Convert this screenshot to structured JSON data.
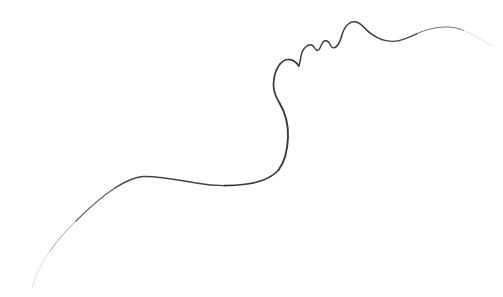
{
  "artwork": {
    "title": "Minimalist Single-Line Face Profile",
    "subject": "human-face-profile-contour",
    "medium": "pencil-line-drawing",
    "orientation": "profile-facing-upper-right",
    "canvas": {
      "width": 503,
      "height": 297,
      "background_color": "#ffffff"
    },
    "stroke": {
      "color": "#3a3a3e",
      "light_color": "#9a9aa0",
      "faint_color": "#cfcfd4",
      "max_width": 2.0,
      "min_width": 0.35
    },
    "anatomy_landmarks": [
      {
        "name": "tail-start-lower-left",
        "x": 32,
        "y": 286,
        "note": "faint fading tail tip"
      },
      {
        "name": "shoulder-rise",
        "x": 72,
        "y": 232
      },
      {
        "name": "shoulder-crest",
        "x": 140,
        "y": 176,
        "note": "highest point of left hump"
      },
      {
        "name": "trapezius-valley",
        "x": 222,
        "y": 185,
        "note": "flat low point"
      },
      {
        "name": "neck-base-turn",
        "x": 272,
        "y": 176
      },
      {
        "name": "neck-bulge",
        "x": 288,
        "y": 132,
        "note": "rightmost point of neck"
      },
      {
        "name": "neck-inflection",
        "x": 274,
        "y": 96
      },
      {
        "name": "chin-crest",
        "x": 288,
        "y": 60
      },
      {
        "name": "chin-notch",
        "x": 301,
        "y": 52,
        "note": "mentolabial sulcus"
      },
      {
        "name": "lower-lip",
        "x": 310,
        "y": 44
      },
      {
        "name": "lip-gap",
        "x": 317,
        "y": 49
      },
      {
        "name": "upper-lip",
        "x": 324,
        "y": 41
      },
      {
        "name": "philtrum-dip",
        "x": 331,
        "y": 46
      },
      {
        "name": "nose-base",
        "x": 338,
        "y": 40
      },
      {
        "name": "nose-tip",
        "x": 352,
        "y": 22,
        "note": "apex of the nose"
      },
      {
        "name": "nasal-bridge-dip",
        "x": 396,
        "y": 40,
        "note": "nasion / brow hollow"
      },
      {
        "name": "brow-forehead-crest",
        "x": 452,
        "y": 28
      },
      {
        "name": "tail-end-upper-right",
        "x": 492,
        "y": 42,
        "note": "faint fading tail tip"
      }
    ],
    "path_segments": [
      {
        "name": "lower-left-fading-tail",
        "d": "M 32.5 286.5 C 36 275 42 262 50.5 250.5",
        "stroke_width": 0.5,
        "opacity": 0.35
      },
      {
        "name": "shoulder-ascent",
        "d": "M 50.5 250.5 C 58 240 66 230 76 221",
        "stroke_width": 0.8,
        "opacity": 0.6
      },
      {
        "name": "shoulder-upper-slope",
        "d": "M 76 221 C 88 209 101 197 115 188",
        "stroke_width": 1.1,
        "opacity": 0.82
      },
      {
        "name": "shoulder-crest-to-valley",
        "d": "M 115 188 C 126 181 134 177 143 176.5 C 160 176 178 180 196 183 C 206 184.8 214 185.6 224 185.6",
        "stroke_width": 1.45,
        "opacity": 0.95
      },
      {
        "name": "valley-to-neck-base",
        "d": "M 224 185.6 C 238 185.6 252 184 262 180.5 C 269 178 274 175 278.5 170",
        "stroke_width": 1.6,
        "opacity": 1.0
      },
      {
        "name": "neck-column",
        "d": "M 278.5 170 C 284 163 287.5 150 288 137 C 288.3 124 285 112 279.5 103",
        "stroke_width": 1.9,
        "opacity": 1.0
      },
      {
        "name": "neck-to-jaw",
        "d": "M 279.5 103 C 275.5 96.5 273.2 91 273.5 84 C 273.8 76 276 69 280 64",
        "stroke_width": 1.7,
        "opacity": 1.0
      },
      {
        "name": "chin-curve",
        "d": "M 280 64 C 283 60.5 286.5 59 290 59.6 C 294 60.2 297 63 298.8 66",
        "stroke_width": 1.6,
        "opacity": 1.0
      },
      {
        "name": "chin-to-lower-lip",
        "d": "M 298.8 66 C 300.4 62 300.6 57 301.6 53.6 C 302.8 49.8 305 47 308 45.4",
        "stroke_width": 1.5,
        "opacity": 1.0
      },
      {
        "name": "lower-lip-bump",
        "d": "M 308 45.4 C 310.6 44.2 312.6 45 313.8 46.8 C 315 48.6 315.6 50 316.8 50.4",
        "stroke_width": 1.4,
        "opacity": 1.0
      },
      {
        "name": "lip-gap-to-upper-lip",
        "d": "M 316.8 50.4 C 318.6 50.8 320 48.6 321.4 45 C 322.6 42 324 40.4 326 40.8",
        "stroke_width": 1.4,
        "opacity": 1.0
      },
      {
        "name": "upper-lip-to-nose-base",
        "d": "M 326 40.8 C 328.4 41.2 329.8 43.6 330.8 45.8 C 332 48.2 334 48.6 336.6 46.4",
        "stroke_width": 1.4,
        "opacity": 1.0
      },
      {
        "name": "nose-underside",
        "d": "M 336.6 46.4 C 339.4 44 340.6 40 342 34.8 C 343.6 29 346.6 24.4 351 22.4",
        "stroke_width": 1.5,
        "opacity": 1.0
      },
      {
        "name": "nose-tip-to-bridge",
        "d": "M 351 22.4 C 355.6 20.6 359.4 22.6 363 26.6 C 368 32 374 37 382 39.6",
        "stroke_width": 1.5,
        "opacity": 1.0
      },
      {
        "name": "nasion-hollow",
        "d": "M 382 39.6 C 388 41.6 393 42 399 40.6 C 405.5 39 411 36.4 417 33.6",
        "stroke_width": 1.3,
        "opacity": 0.95
      },
      {
        "name": "brow-to-forehead",
        "d": "M 417 33.6 C 426 29.6 435 27.2 445 27 C 452 26.9 458 28 463 30.2",
        "stroke_width": 1.0,
        "opacity": 0.72
      },
      {
        "name": "upper-right-fading-tail",
        "d": "M 463 30.2 C 471 33.6 478 37.6 484 41.2 C 487.5 43.3 490 44.8 492 46",
        "stroke_width": 0.55,
        "opacity": 0.3
      }
    ]
  }
}
